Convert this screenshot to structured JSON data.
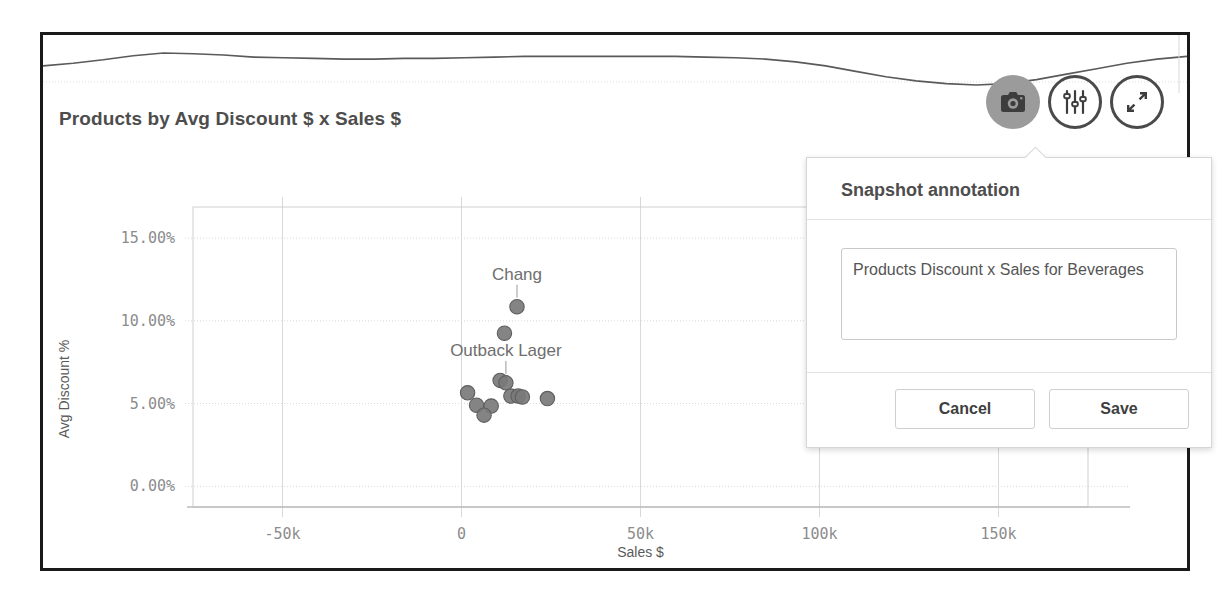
{
  "panel": {
    "title": "Products by Avg Discount $ x Sales $"
  },
  "toolbar": {
    "snapshot_label": "snapshot",
    "snapshot_icon": "camera-icon",
    "settings_label": "settings",
    "settings_icon": "sliders-icon",
    "expand_label": "expand",
    "expand_icon": "expand-arrows-icon"
  },
  "annotation_dialog": {
    "title": "Snapshot annotation",
    "text_value": "Products Discount x Sales for Beverages",
    "text_placeholder": "",
    "cancel_label": "Cancel",
    "save_label": "Save"
  },
  "colors": {
    "frame": "#1a1a1a",
    "title_text": "#4d4d4d",
    "axis_text": "#8c8c8c",
    "grid": "#d9d9d9",
    "point_fill": "#7a7a7a",
    "point_stroke": "#5e5e5e",
    "sparkline": "#5a5a5a",
    "toolbar_active_bg": "#9b9b9b",
    "toolbar_border": "#4a4a4a"
  },
  "chart_data": {
    "type": "scatter",
    "title": "Products by Avg Discount $ x Sales $",
    "xlabel": "Sales $",
    "ylabel": "Avg Discount %",
    "xlim": [
      -75000,
      175000
    ],
    "ylim": [
      -0.0125,
      0.16875
    ],
    "xticks": [
      -50000,
      0,
      50000,
      100000,
      150000
    ],
    "xtick_labels": [
      "-50k",
      "0",
      "50k",
      "100k",
      "150k"
    ],
    "yticks": [
      0.0,
      0.05,
      0.1,
      0.15
    ],
    "ytick_labels": [
      "0.00%",
      "5.00%",
      "10.00%",
      "15.00%"
    ],
    "grid": true,
    "legend": "none",
    "points": [
      {
        "label": "Chang",
        "x": 15500,
        "y": 0.1085,
        "annotated": true
      },
      {
        "label": "",
        "x": 12000,
        "y": 0.0925,
        "annotated": false
      },
      {
        "label": "",
        "x": 10800,
        "y": 0.064,
        "annotated": false
      },
      {
        "label": "Outback Lager",
        "x": 12400,
        "y": 0.0625,
        "annotated": true
      },
      {
        "label": "",
        "x": 1700,
        "y": 0.0565,
        "annotated": false
      },
      {
        "label": "",
        "x": 13800,
        "y": 0.0545,
        "annotated": false
      },
      {
        "label": "",
        "x": 15800,
        "y": 0.0545,
        "annotated": false
      },
      {
        "label": "",
        "x": 17000,
        "y": 0.054,
        "annotated": false
      },
      {
        "label": "",
        "x": 24000,
        "y": 0.053,
        "annotated": false
      },
      {
        "label": "",
        "x": 4200,
        "y": 0.049,
        "annotated": false
      },
      {
        "label": "",
        "x": 8300,
        "y": 0.0485,
        "annotated": false
      },
      {
        "label": "",
        "x": 6300,
        "y": 0.043,
        "annotated": false
      }
    ],
    "sparkline": {
      "type": "line",
      "values": [
        64,
        68,
        73,
        79,
        83,
        82,
        80,
        77,
        76,
        75,
        74,
        74,
        75,
        75,
        76,
        77,
        78,
        78,
        78,
        78,
        78,
        78,
        77,
        76,
        74,
        70,
        64,
        56,
        48,
        42,
        38,
        36,
        38,
        44,
        52,
        60,
        68,
        74,
        78
      ]
    }
  }
}
